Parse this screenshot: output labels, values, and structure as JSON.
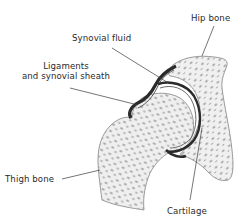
{
  "diagram": {
    "labels": {
      "hip_bone": "Hip bone",
      "synovial_fluid": "Synovial fluid",
      "ligaments_line1": "Ligaments",
      "ligaments_line2": "and synovial sheath",
      "thigh_bone": "Thigh bone",
      "cartilage": "Cartilage"
    },
    "colors": {
      "background": "#ffffff",
      "bone_fill": "#eeeeee",
      "bone_outline": "#9a9a9a",
      "spongy_texture": "#8c8c8c",
      "ligament": "#2b2b2b",
      "leader_line": "#3a3a3a",
      "text": "#2a2a2a"
    }
  }
}
